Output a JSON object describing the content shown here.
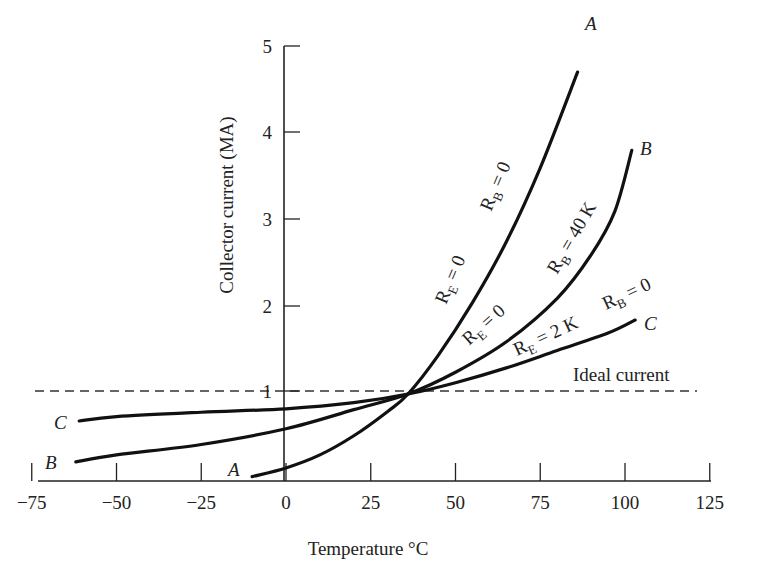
{
  "chart_data": {
    "type": "line",
    "title": "",
    "xlabel": "Temperature °C",
    "ylabel": "Collector current (MA)",
    "xlim": [
      -75,
      125
    ],
    "ylim": [
      0,
      5
    ],
    "x_ticks": [
      "−75",
      "−50",
      "−25",
      "0",
      "25",
      "50",
      "75",
      "100",
      "125"
    ],
    "y_ticks": [
      "1",
      "2",
      "3",
      "4",
      "5"
    ],
    "grid": false,
    "legend": "none (curves labeled inline)",
    "reference_line": {
      "label": "Ideal current",
      "y": 1.0,
      "style": "dashed"
    },
    "series": [
      {
        "name": "A",
        "annotation": [
          "R_E = 0",
          "R_B = 0"
        ],
        "x": [
          -10,
          0,
          10,
          20,
          30,
          36,
          45,
          55,
          65,
          75,
          86
        ],
        "y": [
          0.05,
          0.15,
          0.3,
          0.52,
          0.8,
          1.0,
          1.45,
          2.05,
          2.75,
          3.6,
          4.7
        ]
      },
      {
        "name": "B",
        "annotation": [
          "R_E = 0",
          "R_B = 40 K"
        ],
        "x": [
          -62,
          -50,
          -25,
          0,
          20,
          36,
          50,
          65,
          80,
          90,
          97,
          102
        ],
        "y": [
          0.22,
          0.3,
          0.42,
          0.6,
          0.82,
          1.0,
          1.25,
          1.6,
          2.1,
          2.6,
          3.1,
          3.8
        ]
      },
      {
        "name": "C",
        "annotation": [
          "R_E = 2 K",
          "R_B = 0"
        ],
        "x": [
          -61,
          -50,
          -25,
          0,
          20,
          36,
          50,
          65,
          80,
          95,
          103
        ],
        "y": [
          0.69,
          0.74,
          0.79,
          0.83,
          0.9,
          1.0,
          1.13,
          1.3,
          1.5,
          1.7,
          1.85
        ]
      }
    ]
  },
  "labels": {
    "xlabel": "Temperature °C",
    "ylabel": "Collector current (MA)",
    "ideal": "Ideal current",
    "x_ticks": [
      "−75",
      "−50",
      "−25",
      "0",
      "25",
      "50",
      "75",
      "100",
      "125"
    ],
    "y_ticks": [
      "1",
      "2",
      "3",
      "4",
      "5"
    ],
    "curve_A": "A",
    "curve_B": "B",
    "curve_C": "C",
    "a_re": "R",
    "a_re_sub": "E",
    "a_re_val": " = 0",
    "a_rb": "R",
    "a_rb_sub": "B",
    "a_rb_val": " = 0",
    "b_re": "R",
    "b_re_sub": "E",
    "b_re_val": " = 0",
    "b_rb": "R",
    "b_rb_sub": "B",
    "b_rb_val": " = 40 K",
    "c_re": "R",
    "c_re_sub": "E",
    "c_re_val": " = 2 K",
    "c_rb": "R",
    "c_rb_sub": "B",
    "c_rb_val": " = 0"
  }
}
